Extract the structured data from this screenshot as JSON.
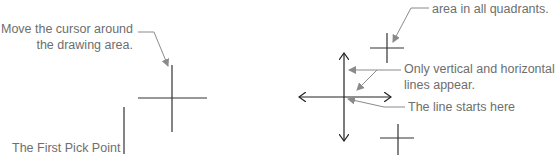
{
  "diagram": {
    "left_panel": {
      "instruction_label": [
        "Move the cursor around",
        "the drawing area."
      ],
      "first_pick_point_label": "The First Pick Point"
    },
    "right_panel": {
      "quadrants_label": "area in all quadrants.",
      "ortho_label": [
        "Only vertical and horizontal",
        "lines appear."
      ],
      "start_label": "The line starts here"
    },
    "colors": {
      "line": "#2a2a2a",
      "callout": "#8a8a8a",
      "text": "#6e6e6e",
      "background": "#ffffff"
    }
  }
}
